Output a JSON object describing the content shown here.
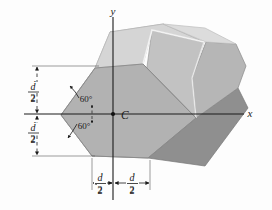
{
  "figure": {
    "background_color": "#fdfdfd",
    "axes": {
      "x_label": "x",
      "y_label": "y",
      "axis_color": "#1a1a1a"
    },
    "centroid": {
      "label": "C",
      "marker": "filled-dot"
    },
    "angles": [
      {
        "id": "upper",
        "value": "60°"
      },
      {
        "id": "lower",
        "value": "60°"
      }
    ],
    "dimensions": [
      {
        "id": "vertical-upper",
        "numerator": "d",
        "denominator": "2",
        "orientation": "vertical"
      },
      {
        "id": "vertical-lower",
        "numerator": "d",
        "denominator": "2",
        "orientation": "vertical"
      },
      {
        "id": "horizontal-left",
        "numerator": "d",
        "denominator": "2",
        "orientation": "horizontal"
      },
      {
        "id": "horizontal-right",
        "numerator": "d",
        "denominator": "2",
        "orientation": "horizontal"
      }
    ],
    "solid": {
      "face_colors": {
        "front_hexagon": "#b0b0b0",
        "top_light": "#d8d8d8",
        "top_upper": "#c9c9c9",
        "side_right": "#bdbdbd",
        "side_dark": "#8f8f8f",
        "end_face": "#a8a8a8"
      },
      "edge_color": "#6e6e6e",
      "highlight_edge_color": "#efefef"
    }
  }
}
